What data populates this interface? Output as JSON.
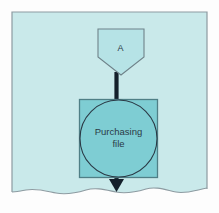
{
  "document": {
    "kind": "scanned-flowchart-fragment",
    "page_background_color": "#c9e9ea",
    "page_border_color": "#8d9ba1",
    "paper_margin_color": "#fdfdfd",
    "torn_edge": "wavy-bottom"
  },
  "diagram": {
    "type": "flowchart",
    "title": "",
    "nodes": [
      {
        "id": "connector-a",
        "shape": "pentagon-connector",
        "label": "A",
        "fill_color": "#b6e3e6",
        "stroke_color": "#6f8289",
        "x": 97,
        "y": 28,
        "width": 48,
        "height": 47
      },
      {
        "id": "purchasing-file",
        "shape": "square-with-inscribed-circle",
        "label_line_1": "Purchasing",
        "label_line_2": "file",
        "square_fill_color": "#7ecdd3",
        "square_stroke_color": "#4f7f86",
        "circle_stroke_color": "#2b3a46",
        "x": 79,
        "y": 99,
        "width": 78,
        "height": 79
      }
    ],
    "edges": [
      {
        "id": "edge-connector-to-file",
        "from": "connector-a",
        "to": "purchasing-file",
        "style": "thick-line",
        "color": "#14202b",
        "arrowhead": false
      },
      {
        "id": "edge-file-to-next",
        "from": "purchasing-file",
        "to": "",
        "style": "thick-line",
        "color": "#14202b",
        "arrowhead": true,
        "direction": "down"
      }
    ],
    "text_color": "#2b3a46",
    "line_color": "#14202b"
  }
}
